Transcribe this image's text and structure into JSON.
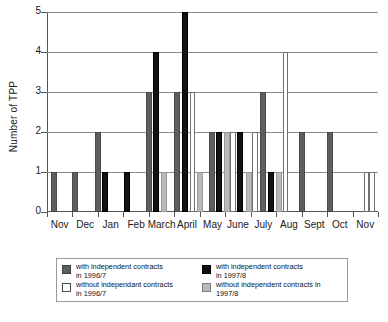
{
  "chart_data": {
    "type": "bar",
    "title": "",
    "xlabel": "",
    "ylabel": "Number of TPP",
    "ylim": [
      0,
      5
    ],
    "yticks": [
      0,
      1,
      2,
      3,
      4,
      5
    ],
    "grid": true,
    "legend_position": "bottom",
    "categories": [
      "Nov",
      "Dec",
      "Jan",
      "Feb",
      "March",
      "April",
      "May",
      "June",
      "July",
      "Aug",
      "Sept",
      "Oct",
      "Nov"
    ],
    "series": [
      {
        "name": "with independent contracts in 1996/7",
        "key": "dgray",
        "color": "#5e5e5e",
        "values": [
          1,
          1,
          2,
          0,
          3,
          3,
          0,
          0,
          3,
          2,
          2,
          0,
          0
        ]
      },
      {
        "name": "with independent contracts in 1997/8",
        "key": "black",
        "color": "#121212",
        "values": [
          0,
          0,
          1,
          1,
          4,
          5,
          2,
          2,
          1,
          0,
          0,
          0,
          0
        ]
      },
      {
        "name": "without independant contracts in 1996/7",
        "key": "white",
        "color": "#ffffff",
        "values": [
          0,
          0,
          0,
          0,
          0,
          3,
          2,
          2,
          4,
          0,
          0,
          0,
          1
        ]
      },
      {
        "name": "without independent contracts in 1997/8",
        "key": "lgray",
        "color": "#b9b9b9",
        "values": [
          0,
          0,
          0,
          0,
          1,
          1,
          2,
          1,
          1,
          0,
          0,
          0,
          0
        ]
      }
    ],
    "bars": [
      {
        "month": "Nov",
        "series": "dgray",
        "value": 1,
        "x": 4.0
      },
      {
        "month": "Dec",
        "series": "dgray",
        "value": 1,
        "x": 24.5
      },
      {
        "month": "Jan",
        "series": "dgray",
        "value": 2,
        "x": 47.5
      },
      {
        "month": "Jan",
        "series": "black",
        "value": 1,
        "x": 54.5
      },
      {
        "month": "Feb",
        "series": "black",
        "value": 1,
        "x": 76.5
      },
      {
        "month": "March",
        "series": "dgray",
        "value": 3,
        "x": 98.5
      },
      {
        "month": "March",
        "series": "black",
        "value": 4,
        "x": 105.5
      },
      {
        "month": "March",
        "series": "lgray",
        "value": 1,
        "x": 114.0
      },
      {
        "month": "April",
        "series": "dgray",
        "value": 3,
        "x": 127.0
      },
      {
        "month": "April",
        "series": "black",
        "value": 5,
        "x": 134.5
      },
      {
        "month": "April",
        "series": "white",
        "value": 3,
        "x": 142.5
      },
      {
        "month": "April",
        "series": "lgray",
        "value": 1,
        "x": 150.0
      },
      {
        "month": "May",
        "series": "dgray",
        "value": 2,
        "x": 161.5
      },
      {
        "month": "May",
        "series": "black",
        "value": 2,
        "x": 168.5
      },
      {
        "month": "May",
        "series": "lgray",
        "value": 2,
        "x": 176.5
      },
      {
        "month": "May",
        "series": "white",
        "value": 2,
        "x": 183.0
      },
      {
        "month": "June",
        "series": "black",
        "value": 2,
        "x": 190.0
      },
      {
        "month": "June",
        "series": "lgray",
        "value": 1,
        "x": 198.5
      },
      {
        "month": "June",
        "series": "white",
        "value": 2,
        "x": 205.0
      },
      {
        "month": "July",
        "series": "dgray",
        "value": 3,
        "x": 213.0
      },
      {
        "month": "July",
        "series": "black",
        "value": 1,
        "x": 221.0
      },
      {
        "month": "July",
        "series": "lgray",
        "value": 1,
        "x": 228.5
      },
      {
        "month": "July",
        "series": "white",
        "value": 4,
        "x": 235.5
      },
      {
        "month": "Aug",
        "series": "dgray",
        "value": 2,
        "x": 252.0
      },
      {
        "month": "Sept",
        "series": "dgray",
        "value": 2,
        "x": 280.0
      },
      {
        "month": "Nov",
        "series": "white",
        "value": 1,
        "x": 316.5
      },
      {
        "month": "Nov",
        "series": "white",
        "value": 1,
        "x": 322.0
      }
    ]
  },
  "legend": {
    "entries": [
      {
        "swatch": "dgray",
        "line1": "with independent contracts",
        "line2": "in 1996/7"
      },
      {
        "swatch": "black",
        "line1": "with independent contracts",
        "line2": "in 1997/8"
      },
      {
        "swatch": "white",
        "line1": "without independant contracts",
        "line2": "in 1996/7"
      },
      {
        "swatch": "lgray",
        "line1": "without independent contracts in",
        "line2": "1997/8"
      }
    ]
  }
}
